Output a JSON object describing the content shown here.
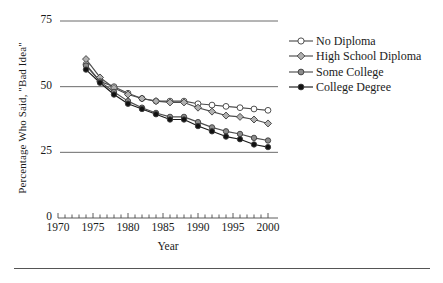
{
  "chart_data": {
    "type": "line",
    "title": "",
    "xlabel": "Year",
    "ylabel": "Percentage Who Said, \"Bad Idea\"",
    "xlim": [
      1970,
      2000
    ],
    "ylim": [
      0,
      75
    ],
    "yticks": [
      0,
      25,
      50,
      75
    ],
    "ytick_labels": [
      "0",
      "25",
      "50",
      "75"
    ],
    "xticks": [
      1970,
      1975,
      1980,
      1985,
      1990,
      1995,
      2000
    ],
    "xtick_labels": [
      "1970",
      "1975",
      "1980",
      "1985",
      "1990",
      "1995",
      "2000"
    ],
    "x_minor_tick_interval": 1,
    "grid": "horizontal-only",
    "legend_position": "right",
    "x": [
      1974,
      1976,
      1978,
      1980,
      1982,
      1984,
      1986,
      1988,
      1990,
      1992,
      1994,
      1996,
      1998,
      2000
    ],
    "series": [
      {
        "name": "No Diploma",
        "marker": "open-circle",
        "marker_fill": "#ffffff",
        "color": "#4d4d4d",
        "values": [
          58.5,
          52.0,
          50.0,
          47.5,
          45.5,
          44.5,
          44.5,
          44.5,
          43.5,
          43.0,
          42.5,
          42.0,
          41.5,
          41.0
        ]
      },
      {
        "name": "High School Diploma",
        "marker": "diamond",
        "marker_fill": "#b0b0b0",
        "color": "#4d4d4d",
        "values": [
          60.5,
          53.5,
          49.5,
          47.0,
          45.5,
          44.5,
          44.0,
          44.0,
          42.0,
          40.5,
          39.0,
          38.5,
          37.5,
          36.0
        ]
      },
      {
        "name": "Some College",
        "marker": "filled-circle",
        "marker_fill": "#8c8c8c",
        "color": "#4d4d4d",
        "values": [
          58.0,
          52.0,
          48.0,
          44.5,
          42.0,
          40.0,
          38.5,
          38.5,
          36.5,
          34.5,
          33.0,
          32.0,
          30.5,
          29.5
        ]
      },
      {
        "name": "College Degree",
        "marker": "filled-circle",
        "marker_fill": "#111111",
        "color": "#1a1a1a",
        "values": [
          56.5,
          51.5,
          47.0,
          43.5,
          41.5,
          39.5,
          37.5,
          37.5,
          35.0,
          33.0,
          31.0,
          30.0,
          28.0,
          27.0
        ]
      }
    ]
  },
  "legend": {
    "items": [
      {
        "label": "No Diploma"
      },
      {
        "label": "High School Diploma"
      },
      {
        "label": "Some College"
      },
      {
        "label": "College Degree"
      }
    ]
  },
  "axes": {
    "x_title": "Year",
    "y_title": "Percentage Who Said, \"Bad Idea\""
  }
}
